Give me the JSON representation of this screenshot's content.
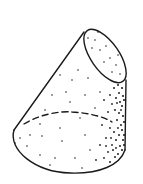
{
  "diagram": {
    "subject": "oblique truncated cone",
    "style": "line drawing with stipple shading",
    "colors": {
      "background": "#ffffff",
      "stroke": "#1a1a1a",
      "stipple": "#222222"
    },
    "parts": [
      {
        "id": "top-face",
        "kind": "ellipse",
        "description": "slanted cut face"
      },
      {
        "id": "left-edge",
        "kind": "line",
        "description": "left silhouette"
      },
      {
        "id": "right-edge",
        "kind": "line",
        "description": "right silhouette"
      },
      {
        "id": "base-front",
        "kind": "solid-arc",
        "description": "visible base rim"
      },
      {
        "id": "base-back",
        "kind": "dashed-arc",
        "description": "hidden base rim"
      }
    ]
  }
}
